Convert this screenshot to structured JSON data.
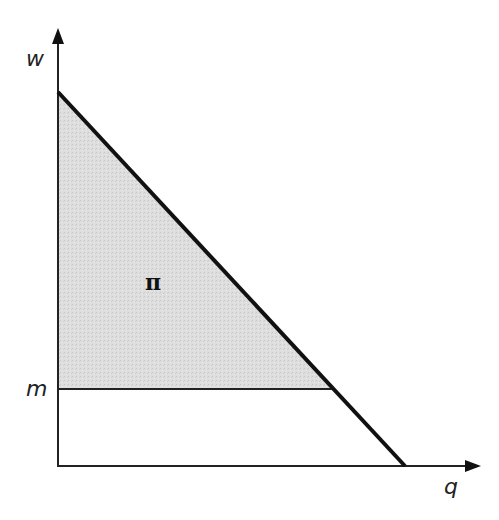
{
  "diagram": {
    "axes": {
      "y_label": "w",
      "x_label": "q"
    },
    "levels": {
      "m_label": "m"
    },
    "regions": {
      "shaded_label": "π"
    },
    "colors": {
      "line": "#111111",
      "shade": "#dcdcdc",
      "background": "#ffffff"
    }
  }
}
